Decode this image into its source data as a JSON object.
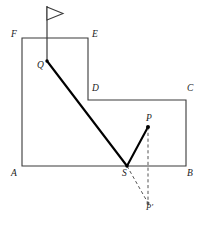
{
  "figure": {
    "background_color": "#ffffff",
    "stroke_color": "#3a3a3a",
    "ray_color": "#000000",
    "dashed_color": "#555555",
    "labels": [
      {
        "id": "label-F",
        "text": "F",
        "x": 11,
        "y": 30
      },
      {
        "id": "label-E",
        "text": "E",
        "x": 92,
        "y": 30
      },
      {
        "id": "label-Q",
        "text": "Q",
        "x": 37,
        "y": 61
      },
      {
        "id": "label-D",
        "text": "D",
        "x": 92,
        "y": 84
      },
      {
        "id": "label-C",
        "text": "C",
        "x": 187,
        "y": 84
      },
      {
        "id": "label-P",
        "text": "P",
        "x": 146,
        "y": 114
      },
      {
        "id": "label-A",
        "text": "A",
        "x": 11,
        "y": 169
      },
      {
        "id": "label-S",
        "text": "S",
        "x": 122,
        "y": 169
      },
      {
        "id": "label-B",
        "text": "B",
        "x": 187,
        "y": 169
      },
      {
        "id": "label-Pprime",
        "text": "P′",
        "x": 146,
        "y": 203
      }
    ],
    "points": {
      "A": {
        "x": 22,
        "y": 166
      },
      "B": {
        "x": 186,
        "y": 166
      },
      "C": {
        "x": 186,
        "y": 100
      },
      "D": {
        "x": 88,
        "y": 100
      },
      "E": {
        "x": 88,
        "y": 38
      },
      "F": {
        "x": 22,
        "y": 38
      },
      "Q": {
        "x": 47,
        "y": 61
      },
      "S": {
        "x": 127,
        "y": 166
      },
      "P": {
        "x": 148,
        "y": 127
      },
      "Pprime": {
        "x": 148,
        "y": 203
      }
    },
    "outline_path": "M 22 38 L 88 38 L 88 100 L 186 100 L 186 166 L 22 166 Z",
    "rays": [
      {
        "id": "ray-Q-S",
        "from": "Q",
        "to": "S",
        "style": "solid",
        "width": 2.1
      },
      {
        "id": "ray-S-P",
        "from": "S",
        "to": "P",
        "style": "solid",
        "width": 2.1
      }
    ],
    "dashed_segments": [
      {
        "id": "dashed-S-Pprime",
        "from": "S",
        "to": "Pprime"
      },
      {
        "id": "dashed-P-Pprime",
        "from": "P",
        "to": "Pprime"
      }
    ],
    "flag": {
      "pole_top": {
        "x": 47,
        "y": 6
      },
      "pole_bottom": {
        "x": 47,
        "y": 61
      },
      "banner_points": "47,7 63,13.5 47,20",
      "banner_fill": "#ffffff"
    },
    "dot_radius": 1.7
  }
}
